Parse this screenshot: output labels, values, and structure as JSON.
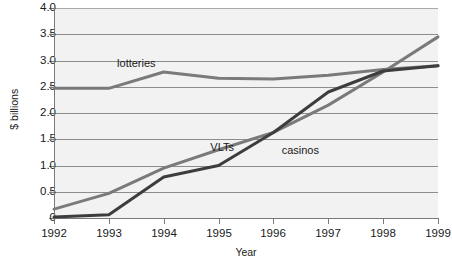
{
  "chart_data": {
    "type": "line",
    "title": "",
    "xlabel": "Year",
    "ylabel": "$ billions",
    "categories": [
      "1992",
      "1993",
      "1994",
      "1995",
      "1996",
      "1997",
      "1998",
      "1999"
    ],
    "x": [
      1992,
      1993,
      1994,
      1995,
      1996,
      1997,
      1998,
      1999
    ],
    "xlim": [
      1992,
      1999
    ],
    "ylim": [
      0,
      4.0
    ],
    "grid": true,
    "legend_position": "inline-annotations",
    "ytick_labels": [
      "0",
      "0.5",
      "1.0",
      "1.5",
      "2.0",
      "2.5",
      "3.0",
      "3.5",
      "4.0"
    ],
    "ytick_values": [
      0,
      0.5,
      1.0,
      1.5,
      2.0,
      2.5,
      3.0,
      3.5,
      4.0
    ],
    "series": [
      {
        "name": "lotteries",
        "color": "#7a7a7a",
        "values": [
          2.47,
          2.47,
          2.78,
          2.66,
          2.65,
          2.72,
          2.83,
          2.9
        ],
        "label_x": 1993.15,
        "label_y": 2.93
      },
      {
        "name": "VLTs",
        "color": "#7a7a7a",
        "values": [
          0.17,
          0.47,
          0.95,
          1.3,
          1.63,
          2.15,
          2.78,
          3.45
        ],
        "label_x": 1994.85,
        "label_y": 1.33
      },
      {
        "name": "casinos",
        "color": "#3d3d3d",
        "values": [
          0.02,
          0.06,
          0.78,
          1.0,
          1.63,
          2.4,
          2.8,
          2.9
        ],
        "label_x": 1996.15,
        "label_y": 1.27
      }
    ]
  },
  "colors": {
    "plot_background": "#f2f2f2",
    "gridline": "#8d8d8d",
    "axis": "#7a7a7a",
    "text": "#1a1a1a"
  }
}
